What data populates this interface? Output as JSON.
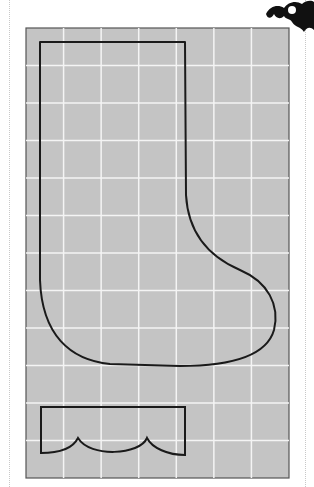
{
  "pattern": {
    "title": "Christmas stocking sewing pattern",
    "grid": {
      "x": 26,
      "y": 28,
      "width": 263,
      "height": 450,
      "columns": 7,
      "rows": 12,
      "background": "#c4c4c4",
      "line_color": "#f4f4f4",
      "border_color": "#555555"
    },
    "pieces": [
      {
        "name": "stocking-body",
        "stroke": "#1a1a1a"
      },
      {
        "name": "stocking-cuff",
        "stroke": "#1a1a1a"
      }
    ],
    "ornament": {
      "name": "holly-ornament",
      "color": "#111111"
    }
  }
}
